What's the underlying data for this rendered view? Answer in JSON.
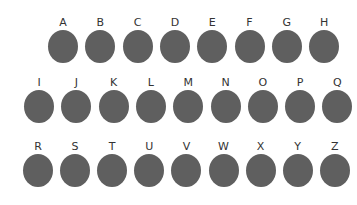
{
  "colors": {
    "oval": "#5f5f5f",
    "label": "#333333",
    "background": "#ffffff"
  },
  "rows": [
    {
      "letters": [
        "A",
        "B",
        "C",
        "D",
        "E",
        "F",
        "G",
        "H"
      ]
    },
    {
      "letters": [
        "I",
        "J",
        "K",
        "L",
        "M",
        "N",
        "O",
        "P",
        "Q"
      ]
    },
    {
      "letters": [
        "R",
        "S",
        "T",
        "U",
        "V",
        "W",
        "X",
        "Y",
        "Z"
      ]
    }
  ]
}
